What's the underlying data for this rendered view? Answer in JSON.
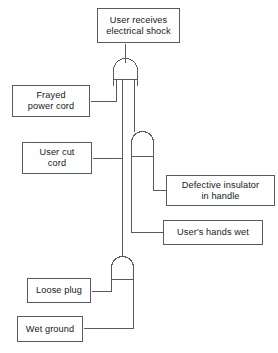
{
  "diagram": {
    "kind": "fault-tree",
    "stroke_color": "#555b5e",
    "text_color": "#16181a",
    "background": "#ffffff",
    "top_event": {
      "id": "user-receives-electrical-shock",
      "label": "User receives\nelectrical shock"
    },
    "gates": [
      {
        "id": "gate-top",
        "type": "and",
        "label": "",
        "inputs": 3
      },
      {
        "id": "gate-middle",
        "type": "and",
        "label": "",
        "inputs": 2
      },
      {
        "id": "gate-bottom",
        "type": "and",
        "label": "",
        "inputs": 2
      }
    ],
    "basic_events": [
      {
        "id": "frayed-power-cord",
        "label": "Frayed\npower cord",
        "gate": "gate-top"
      },
      {
        "id": "user-cut-cord",
        "label": "User cut\ncord",
        "gate": "gate-top"
      },
      {
        "id": "defective-insulator-handle",
        "label": "Defective insulator\nin handle",
        "gate": "gate-middle"
      },
      {
        "id": "users-hands-wet",
        "label": "User's hands wet",
        "gate": "gate-middle"
      },
      {
        "id": "loose-plug",
        "label": "Loose plug",
        "gate": "gate-bottom"
      },
      {
        "id": "wet-ground",
        "label": "Wet ground",
        "gate": "gate-bottom"
      }
    ]
  }
}
